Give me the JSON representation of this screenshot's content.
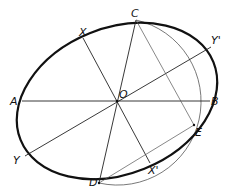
{
  "diagram": {
    "type": "geometry-construction",
    "labels": {
      "A": "A",
      "B": "B",
      "C": "C",
      "D": "D",
      "E": "E",
      "O": "O",
      "X": "X",
      "X_prime": "X'",
      "Y": "Y",
      "Y_prime": "Y'"
    },
    "colors": {
      "ink": "#111111",
      "thin_line": "#333333",
      "faint_line": "#666666"
    }
  }
}
